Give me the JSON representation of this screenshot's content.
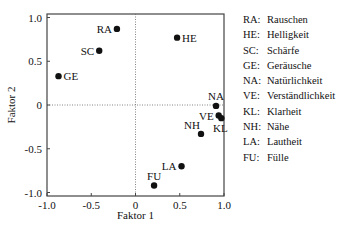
{
  "chart_data": {
    "type": "scatter",
    "title": "",
    "xlabel": "Faktor 1",
    "ylabel": "Faktor 2",
    "xlim": [
      -1.0,
      1.0
    ],
    "ylim": [
      -1.0,
      1.0
    ],
    "xticks": [
      "-1.0",
      "-0.5",
      "0",
      "0.5",
      "1.0"
    ],
    "yticks": [
      "1.0",
      "0.5",
      "0",
      "-0.5",
      "-1.0"
    ],
    "xtick_values": [
      -1.0,
      -0.5,
      0,
      0.5,
      1.0
    ],
    "ytick_values": [
      1.0,
      0.5,
      0,
      -0.5,
      -1.0
    ],
    "grid": false,
    "zero_lines": true,
    "points": [
      {
        "label": "RA",
        "x": -0.21,
        "y": 0.87,
        "label_pos": "left"
      },
      {
        "label": "HE",
        "x": 0.47,
        "y": 0.77,
        "label_pos": "right"
      },
      {
        "label": "SC",
        "x": -0.41,
        "y": 0.62,
        "label_pos": "left"
      },
      {
        "label": "GE",
        "x": -0.87,
        "y": 0.33,
        "label_pos": "right"
      },
      {
        "label": "NA",
        "x": 0.91,
        "y": -0.01,
        "label_pos": "above"
      },
      {
        "label": "VE",
        "x": 0.94,
        "y": -0.12,
        "label_pos": "left"
      },
      {
        "label": "KL",
        "x": 0.97,
        "y": -0.15,
        "label_pos": "below"
      },
      {
        "label": "NH",
        "x": 0.74,
        "y": -0.33,
        "label_pos": "aboveleft"
      },
      {
        "label": "LA",
        "x": 0.52,
        "y": -0.7,
        "label_pos": "left"
      },
      {
        "label": "FU",
        "x": 0.21,
        "y": -0.92,
        "label_pos": "above"
      }
    ],
    "legend": [
      {
        "code": "RA:",
        "name": "Rauschen"
      },
      {
        "code": "HE:",
        "name": "Helligkeit"
      },
      {
        "code": "SC:",
        "name": "Schärfe"
      },
      {
        "code": "GE:",
        "name": "Geräusche"
      },
      {
        "code": "NA:",
        "name": "Natürlichkeit"
      },
      {
        "code": "VE:",
        "name": "Verständlichkeit"
      },
      {
        "code": "KL:",
        "name": "Klarheit"
      },
      {
        "code": "NH:",
        "name": "Nähe"
      },
      {
        "code": "LA:",
        "name": "Lautheit"
      },
      {
        "code": "FU:",
        "name": "Fülle"
      }
    ],
    "legend_position": "right"
  }
}
